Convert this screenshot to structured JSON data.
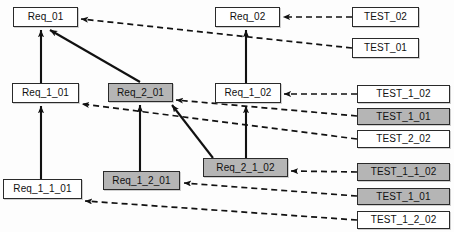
{
  "diagram": {
    "colors": {
      "box_fill_plain": "#ffffff",
      "box_fill_shaded": "#b5b5b5",
      "box_border": "#2a2a2a",
      "solid_edge": "#111111",
      "dashed_edge": "#111111",
      "background": "#fdfdfd"
    },
    "legend_hint": {
      "solid_arrow_meaning": "decomposition / derived-from",
      "dashed_arrow_meaning": "test verifies requirement"
    },
    "nodes": [
      {
        "id": "req_01",
        "label": "Req_01",
        "shaded": false,
        "x": 13,
        "y": 7,
        "w": 65,
        "h": 20
      },
      {
        "id": "req_02",
        "label": "Req_02",
        "shaded": false,
        "x": 215,
        "y": 7,
        "w": 65,
        "h": 20
      },
      {
        "id": "test_02",
        "label": "TEST_02",
        "shaded": false,
        "x": 352,
        "y": 7,
        "w": 67,
        "h": 20
      },
      {
        "id": "test_01",
        "label": "TEST_01",
        "shaded": false,
        "x": 352,
        "y": 38,
        "w": 67,
        "h": 20
      },
      {
        "id": "req_1_01",
        "label": "Req_1_01",
        "shaded": false,
        "x": 12,
        "y": 83,
        "w": 67,
        "h": 20
      },
      {
        "id": "req_2_01",
        "label": "Req_2_01",
        "shaded": true,
        "x": 108,
        "y": 83,
        "w": 65,
        "h": 19
      },
      {
        "id": "req_1_02",
        "label": "Req_1_02",
        "shaded": false,
        "x": 215,
        "y": 83,
        "w": 66,
        "h": 20
      },
      {
        "id": "test_1_02",
        "label": "TEST_1_02",
        "shaded": false,
        "x": 357,
        "y": 85,
        "w": 93,
        "h": 18
      },
      {
        "id": "test_1_01_a",
        "label": "TEST_1_01",
        "shaded": true,
        "x": 357,
        "y": 108,
        "w": 93,
        "h": 17
      },
      {
        "id": "test_2_02",
        "label": "TEST_2_02",
        "shaded": false,
        "x": 357,
        "y": 130,
        "w": 93,
        "h": 18
      },
      {
        "id": "req_2_1_02",
        "label": "Req_2_1_02",
        "shaded": true,
        "x": 203,
        "y": 158,
        "w": 85,
        "h": 19
      },
      {
        "id": "test_1_1_02",
        "label": "TEST_1_1_02",
        "shaded": true,
        "x": 357,
        "y": 163,
        "w": 93,
        "h": 18
      },
      {
        "id": "req_1_2_01",
        "label": "Req_1_2_01",
        "shaded": true,
        "x": 103,
        "y": 171,
        "w": 77,
        "h": 19
      },
      {
        "id": "req_1_1_01",
        "label": "Req_1_1_01",
        "shaded": false,
        "x": 3,
        "y": 179,
        "w": 79,
        "h": 20
      },
      {
        "id": "test_1_01_b",
        "label": "TEST_1_01",
        "shaded": true,
        "x": 357,
        "y": 188,
        "w": 93,
        "h": 17
      },
      {
        "id": "test_1_2_02",
        "label": "TEST_1_2_02",
        "shaded": false,
        "x": 357,
        "y": 211,
        "w": 93,
        "h": 18
      }
    ],
    "solid_edges": [
      {
        "id": "e-req_1_01-req_01",
        "from": "req_1_01",
        "to": "req_01",
        "points": "41,83 41,30"
      },
      {
        "id": "e-req_2_01-req_01",
        "from": "req_2_01",
        "to": "req_01",
        "points": "140,82 50,30"
      },
      {
        "id": "e-req_1_1_01-req_1_01",
        "from": "req_1_1_01",
        "to": "req_1_01",
        "points": "41,179 41,106"
      },
      {
        "id": "e-req_1_2_01-req_2_01",
        "from": "req_1_2_01",
        "to": "req_2_01",
        "points": "140,171 140,105"
      },
      {
        "id": "e-req_2_1_02-req_2_01",
        "from": "req_2_1_02",
        "to": "req_2_01",
        "points": "213,158 172,105"
      },
      {
        "id": "e-req_1_02-req_02",
        "from": "req_1_02",
        "to": "req_02",
        "points": "246,83 246,30"
      },
      {
        "id": "e-req_2_1_02-req_1_02",
        "from": "req_2_1_02",
        "to": "req_1_02",
        "points": "246,158 246,106"
      }
    ],
    "dashed_edges": [
      {
        "id": "e-test_02-req_02",
        "from": "test_02",
        "to": "req_02",
        "points": "352,17 283,17"
      },
      {
        "id": "e-test_01-req_01",
        "from": "test_01",
        "to": "req_01",
        "points": "352,48 81,19"
      },
      {
        "id": "e-test_1_02-req_1_02",
        "from": "test_1_02",
        "to": "req_1_02",
        "points": "357,94 284,94"
      },
      {
        "id": "e-test_1_01a-req_2_01",
        "from": "test_1_01_a",
        "to": "req_2_01",
        "points": "357,116 176,100"
      },
      {
        "id": "e-test_2_02-req_2_01",
        "from": "test_2_02",
        "to": "req_1_01",
        "points": "357,139 82,104"
      },
      {
        "id": "e-test_1_1_02-req_2_1_02",
        "from": "test_1_1_02",
        "to": "req_2_1_02",
        "points": "357,172 291,171"
      },
      {
        "id": "e-test_1_01b-req_1_2_01",
        "from": "test_1_01_b",
        "to": "req_1_2_01",
        "points": "357,196 184,183"
      },
      {
        "id": "e-test_1_2_02-req_1_1_01",
        "from": "test_1_2_02",
        "to": "req_1_1_01",
        "points": "357,220 85,201"
      }
    ]
  }
}
